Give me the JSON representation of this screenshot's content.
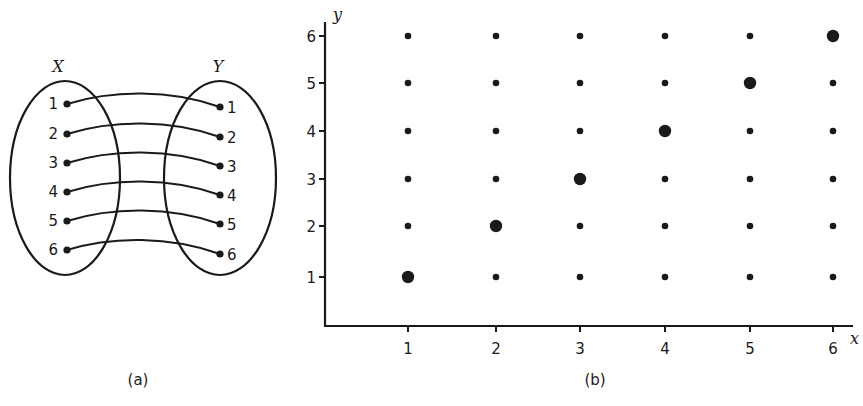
{
  "panel_a": {
    "caption": "(a)",
    "set_x_label": "X",
    "set_y_label": "Y",
    "x_elements": [
      "1",
      "2",
      "3",
      "4",
      "5",
      "6"
    ],
    "y_elements": [
      "1",
      "2",
      "3",
      "4",
      "5",
      "6"
    ],
    "mapping": [
      [
        1,
        1
      ],
      [
        2,
        2
      ],
      [
        3,
        3
      ],
      [
        4,
        4
      ],
      [
        5,
        5
      ],
      [
        6,
        6
      ]
    ]
  },
  "panel_b": {
    "caption": "(b)",
    "x_axis_label": "x",
    "y_axis_label": "y",
    "x_ticks": [
      "1",
      "2",
      "3",
      "4",
      "5",
      "6"
    ],
    "y_ticks": [
      "1",
      "2",
      "3",
      "4",
      "5",
      "6"
    ]
  },
  "chart_data": {
    "type": "scatter",
    "title": "",
    "xlabel": "x",
    "ylabel": "y",
    "x_ticks": [
      1,
      2,
      3,
      4,
      5,
      6
    ],
    "y_ticks": [
      1,
      2,
      3,
      4,
      5,
      6
    ],
    "grid": false,
    "series": [
      {
        "name": "all pairs (X × Y)",
        "marker": "small dot",
        "points": [
          [
            1,
            1
          ],
          [
            1,
            2
          ],
          [
            1,
            3
          ],
          [
            1,
            4
          ],
          [
            1,
            5
          ],
          [
            1,
            6
          ],
          [
            2,
            1
          ],
          [
            2,
            2
          ],
          [
            2,
            3
          ],
          [
            2,
            4
          ],
          [
            2,
            5
          ],
          [
            2,
            6
          ],
          [
            3,
            1
          ],
          [
            3,
            2
          ],
          [
            3,
            3
          ],
          [
            3,
            4
          ],
          [
            3,
            5
          ],
          [
            3,
            6
          ],
          [
            4,
            1
          ],
          [
            4,
            2
          ],
          [
            4,
            3
          ],
          [
            4,
            4
          ],
          [
            4,
            5
          ],
          [
            4,
            6
          ],
          [
            5,
            1
          ],
          [
            5,
            2
          ],
          [
            5,
            3
          ],
          [
            5,
            4
          ],
          [
            5,
            5
          ],
          [
            5,
            6
          ],
          [
            6,
            1
          ],
          [
            6,
            2
          ],
          [
            6,
            3
          ],
          [
            6,
            4
          ],
          [
            6,
            5
          ],
          [
            6,
            6
          ]
        ]
      },
      {
        "name": "relation y = x",
        "marker": "large dot",
        "points": [
          [
            1,
            1
          ],
          [
            2,
            2
          ],
          [
            3,
            3
          ],
          [
            4,
            4
          ],
          [
            5,
            5
          ],
          [
            6,
            6
          ]
        ]
      }
    ]
  }
}
